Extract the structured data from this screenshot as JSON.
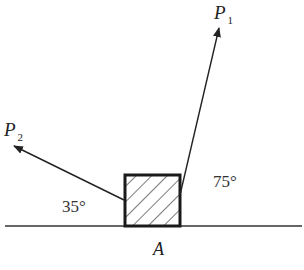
{
  "diagram": {
    "title": "",
    "colors": {
      "line": "#222222",
      "background": "#ffffff"
    },
    "ground": {
      "label": ""
    },
    "block": {
      "label": "A",
      "fill": "hatched"
    },
    "forces": [
      {
        "name": "P",
        "subscript": "1",
        "angle_label": "75°",
        "angle_deg": 75,
        "side": "right"
      },
      {
        "name": "P",
        "subscript": "2",
        "angle_label": "35°",
        "angle_deg": 35,
        "side": "left"
      }
    ]
  }
}
